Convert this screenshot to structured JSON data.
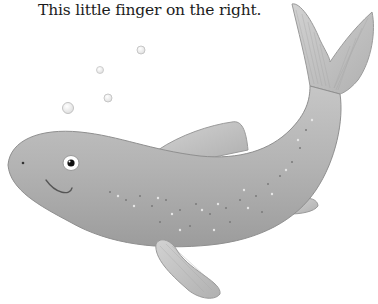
{
  "page": {
    "caption": "This little finger on the right."
  },
  "illustration": {
    "subject": "fish",
    "icon": "fish-icon",
    "bubble_count": 4,
    "colors": {
      "body": "#a9a9a9",
      "body_light": "#c9c9c9",
      "fin": "#bdbdbd",
      "outline": "#8a8a8a",
      "eye_white": "#ffffff",
      "pupil": "#111111"
    }
  }
}
